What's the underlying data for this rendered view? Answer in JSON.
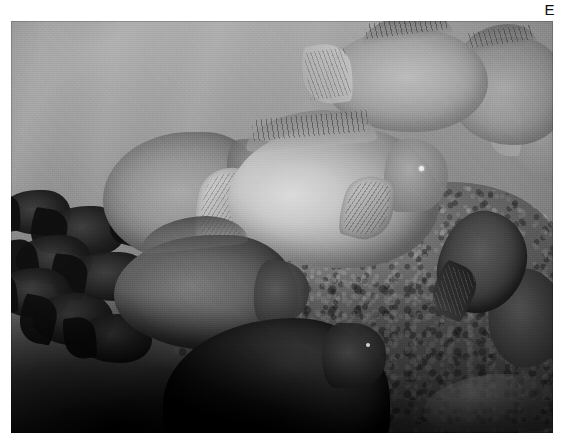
{
  "page": {
    "background_color": "#ffffff",
    "width": 565,
    "height": 445
  },
  "figure": {
    "label": "E",
    "label_color": "#0d0d0d",
    "caption": "",
    "plate": {
      "name": "underwater-reef-photograph",
      "description": "Black-and-white underwater photograph of a school of bumphead parrotfish swimming over a coral reef",
      "color_mode": "grayscale",
      "x": 11,
      "y": 21,
      "width": 542,
      "height": 412,
      "tones": {
        "water_haze": "#9b9b9b",
        "highlight_fish": "#d8d8d8",
        "midtone_fish": "#8f8f8f",
        "reef_substrate": "#6e6e6e",
        "shadow_foreground": "#0a0a0a",
        "sand_patch": "#c0c0c0"
      }
    },
    "subjects": [
      {
        "name": "fish-hero",
        "label": "large bumphead parrotfish, brightly lit, centre-right"
      },
      {
        "name": "fish-second",
        "label": "parrotfish with broad pale tail fan, centre-left"
      },
      {
        "name": "fish-front",
        "label": "darker parrotfish in foreground, lower centre-left"
      },
      {
        "name": "fish-bottom",
        "label": "large dark parrotfish silhouette, bottom centre"
      },
      {
        "name": "fish-top-a",
        "label": "hazy parrotfish in background, upper right"
      },
      {
        "name": "fish-top-b",
        "label": "second hazy parrotfish, upper right corner"
      },
      {
        "name": "fish-edge-right",
        "label": "partial fish at right edge"
      },
      {
        "name": "fish-reef-right",
        "label": "dark fish over reef, right side"
      },
      {
        "name": "fish-reef-right-2",
        "label": "second dark fish over reef, lower right"
      },
      {
        "name": "school-silhouettes",
        "label": "school of dark fish silhouettes along left edge"
      },
      {
        "name": "coral-reef",
        "label": "textured coral rubble substrate across lower right"
      },
      {
        "name": "sand-patch",
        "label": "pale sand patch, bottom right"
      }
    ]
  }
}
